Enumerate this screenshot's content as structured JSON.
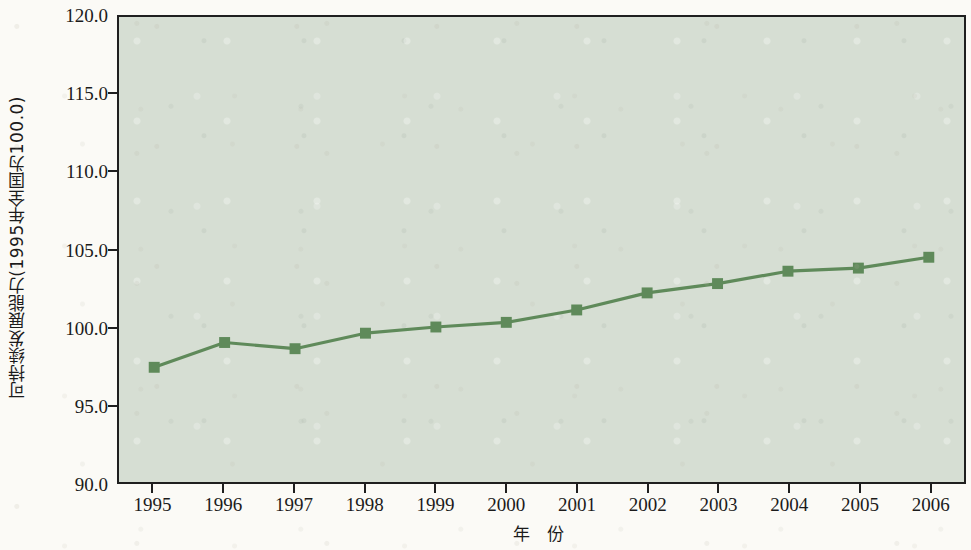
{
  "chart_data": {
    "type": "line",
    "title": "",
    "xlabel": "年  份",
    "ylabel": "可持续发展能力(1995年全国为100.0)",
    "x": [
      1995,
      1996,
      1997,
      1998,
      1999,
      2000,
      2001,
      2002,
      2003,
      2004,
      2005,
      2006
    ],
    "categories": [
      "1995",
      "1996",
      "1997",
      "1998",
      "1999",
      "2000",
      "2001",
      "2002",
      "2003",
      "2004",
      "2005",
      "2006"
    ],
    "values": [
      97.4,
      99.0,
      98.6,
      99.6,
      100.0,
      100.3,
      101.1,
      102.2,
      102.8,
      103.6,
      103.8,
      104.5
    ],
    "series": [
      {
        "name": "可持续发展能力",
        "values": [
          97.4,
          99.0,
          98.6,
          99.6,
          100.0,
          100.3,
          101.1,
          102.2,
          102.8,
          103.6,
          103.8,
          104.5
        ]
      }
    ],
    "ylim": [
      90.0,
      120.0
    ],
    "ytick_labels": [
      "120.0",
      "115.0",
      "110.0",
      "105.0",
      "100.0",
      "95.0",
      "90.0"
    ],
    "ytick_values": [
      120.0,
      115.0,
      110.0,
      105.0,
      100.0,
      95.0,
      90.0
    ],
    "xlim": [
      1994.5,
      2006.5
    ],
    "grid": false,
    "legend": false,
    "marker": "square",
    "colors": {
      "line": "#5f8a5a",
      "marker": "#5f8a5a",
      "plot_background": "#d6ded3",
      "axis": "#1f1f1f",
      "page_background": "#fbfaf6"
    }
  }
}
